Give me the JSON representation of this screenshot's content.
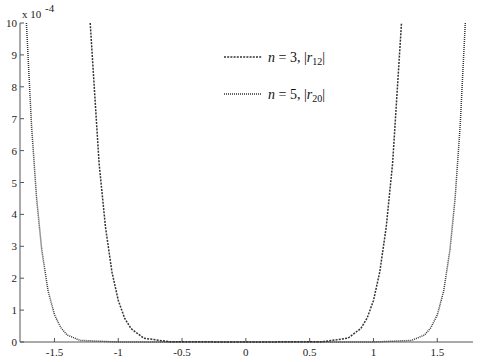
{
  "chart_data": {
    "type": "line",
    "title": "",
    "xlabel": "",
    "ylabel": "",
    "y_scale_label": "x 10^-4",
    "y_exponent": -4,
    "xlim": [
      -1.77,
      1.78
    ],
    "ylim": [
      0,
      10
    ],
    "x_ticks": [
      -1.5,
      -1,
      -0.5,
      0,
      0.5,
      1,
      1.5
    ],
    "x_tick_labels": [
      "-1.5",
      "-1",
      "-0.5",
      "0",
      "0.5",
      "1",
      "1.5"
    ],
    "y_ticks": [
      0,
      1,
      2,
      3,
      4,
      5,
      6,
      7,
      8,
      9,
      10
    ],
    "y_tick_labels": [
      "0",
      "1",
      "2",
      "3",
      "4",
      "5",
      "6",
      "7",
      "8",
      "9",
      "10"
    ],
    "grid": false,
    "legend_position": "upper center",
    "series": [
      {
        "name": "n = 3, |r12|",
        "style": "dashed",
        "x": [
          -1.22,
          -1.15,
          -1.1,
          -1.05,
          -1.0,
          -0.95,
          -0.9,
          -0.8,
          -0.6,
          0,
          0.6,
          0.8,
          0.9,
          0.95,
          1.0,
          1.05,
          1.1,
          1.15,
          1.22
        ],
        "values": [
          10,
          5.6,
          3.6,
          2.2,
          1.3,
          0.75,
          0.42,
          0.12,
          0.01,
          0,
          0.01,
          0.12,
          0.42,
          0.75,
          1.3,
          2.2,
          3.6,
          5.6,
          10
        ]
      },
      {
        "name": "n = 5, |r20|",
        "style": "dotted",
        "x": [
          -1.72,
          -1.68,
          -1.64,
          -1.6,
          -1.55,
          -1.5,
          -1.45,
          -1.4,
          -1.3,
          -1.0,
          0,
          1.0,
          1.3,
          1.4,
          1.45,
          1.5,
          1.55,
          1.6,
          1.64,
          1.68,
          1.72
        ],
        "values": [
          10,
          6.8,
          4.5,
          2.9,
          1.6,
          0.85,
          0.45,
          0.22,
          0.05,
          0,
          0,
          0,
          0.05,
          0.22,
          0.45,
          0.85,
          1.6,
          2.9,
          4.5,
          6.8,
          10
        ]
      }
    ]
  },
  "legend": {
    "items": [
      {
        "label": "n = 3, |r12|",
        "n": "n",
        "eq": " = 3, |",
        "r": "r",
        "sub": "12",
        "end": "|"
      },
      {
        "label": "n = 5, |r20|",
        "n": "n",
        "eq": " = 5, |",
        "r": "r",
        "sub": "20",
        "end": "|"
      }
    ]
  },
  "axes": {
    "y_multiplier": "x 10",
    "y_multiplier_exp": "-4"
  }
}
